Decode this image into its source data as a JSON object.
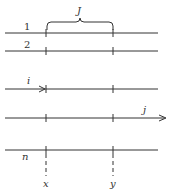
{
  "diagram": {
    "brace_label": "J",
    "lines": [
      {
        "label": "1",
        "y": 33
      },
      {
        "label": "2",
        "y": 51
      },
      {
        "label": "i",
        "y": 89
      },
      {
        "label": "j",
        "y": 118
      },
      {
        "label": "n",
        "y": 150
      }
    ],
    "markers": {
      "left": "x",
      "right": "y"
    },
    "colors": {
      "stroke": "#333333",
      "background": "#ffffff"
    }
  }
}
